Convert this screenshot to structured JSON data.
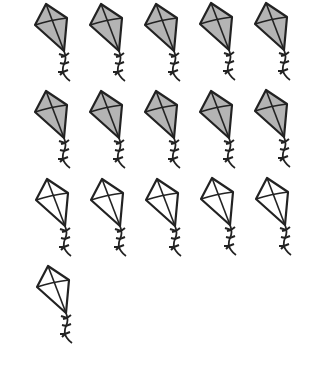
{
  "picture": {
    "description": "Kite counting picture",
    "total_kites": 16,
    "shaded_count": 10,
    "unshaded_count": 6,
    "colors": {
      "shaded_fill": "#b4b4b4",
      "unshaded_fill": "#ffffff",
      "stroke": "#222222"
    },
    "kites": [
      {
        "row": 1,
        "col": 1,
        "x": 32,
        "y": 1,
        "shaded": true
      },
      {
        "row": 1,
        "col": 2,
        "x": 87,
        "y": 1,
        "shaded": true
      },
      {
        "row": 1,
        "col": 3,
        "x": 142,
        "y": 1,
        "shaded": true
      },
      {
        "row": 1,
        "col": 4,
        "x": 197,
        "y": 0,
        "shaded": true
      },
      {
        "row": 1,
        "col": 5,
        "x": 252,
        "y": 0,
        "shaded": true
      },
      {
        "row": 2,
        "col": 1,
        "x": 32,
        "y": 88,
        "shaded": true
      },
      {
        "row": 2,
        "col": 2,
        "x": 87,
        "y": 88,
        "shaded": true
      },
      {
        "row": 2,
        "col": 3,
        "x": 142,
        "y": 88,
        "shaded": true
      },
      {
        "row": 2,
        "col": 4,
        "x": 197,
        "y": 88,
        "shaded": true
      },
      {
        "row": 2,
        "col": 5,
        "x": 252,
        "y": 87,
        "shaded": true
      },
      {
        "row": 3,
        "col": 1,
        "x": 33,
        "y": 176,
        "shaded": false
      },
      {
        "row": 3,
        "col": 2,
        "x": 88,
        "y": 176,
        "shaded": false
      },
      {
        "row": 3,
        "col": 3,
        "x": 143,
        "y": 176,
        "shaded": false
      },
      {
        "row": 3,
        "col": 4,
        "x": 198,
        "y": 175,
        "shaded": false
      },
      {
        "row": 3,
        "col": 5,
        "x": 253,
        "y": 175,
        "shaded": false
      },
      {
        "row": 4,
        "col": 1,
        "x": 34,
        "y": 263,
        "shaded": false
      }
    ]
  }
}
